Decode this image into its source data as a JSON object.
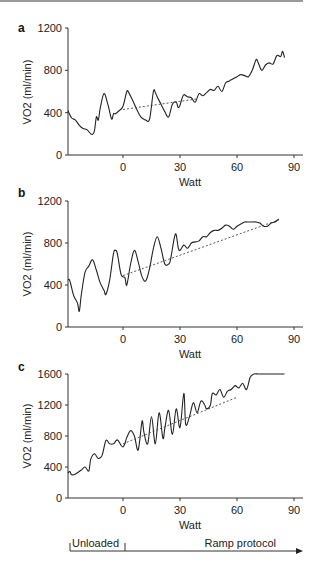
{
  "chart_data": [
    {
      "type": "line",
      "panel": "a",
      "xlabel": "Watt",
      "ylabel": "VO2 (ml/min)",
      "xticks": [
        0,
        30,
        60,
        90
      ],
      "yticks": [
        0,
        400,
        800,
        1200
      ],
      "ylim": [
        0,
        1200
      ],
      "xlim": [
        -29,
        93
      ],
      "series": [
        {
          "name": "VO2",
          "style": "solid",
          "x": [
            -29,
            -27,
            -25,
            -23,
            -21,
            -19,
            -17,
            -16,
            -15,
            -14,
            -13,
            -12,
            -10,
            -8,
            -6,
            -5,
            -4,
            -2,
            0,
            2,
            3,
            5,
            7,
            9,
            10,
            12,
            14,
            16,
            17,
            18,
            20,
            22,
            24,
            26,
            28,
            29,
            30,
            31,
            32,
            34,
            36,
            38,
            40,
            42,
            44,
            46,
            48,
            50,
            52,
            54,
            56,
            58,
            60,
            62,
            64,
            66,
            68,
            70,
            71,
            73,
            75,
            77,
            79,
            81,
            83,
            84,
            85
          ],
          "y": [
            420,
            350,
            330,
            280,
            250,
            240,
            200,
            195,
            230,
            360,
            330,
            440,
            580,
            480,
            340,
            390,
            390,
            420,
            460,
            600,
            590,
            520,
            440,
            370,
            350,
            330,
            340,
            600,
            590,
            550,
            480,
            410,
            360,
            480,
            500,
            450,
            470,
            530,
            570,
            550,
            540,
            500,
            580,
            560,
            590,
            620,
            610,
            650,
            600,
            680,
            700,
            720,
            740,
            760,
            750,
            740,
            800,
            900,
            880,
            800,
            850,
            870,
            860,
            940,
            930,
            980,
            920
          ]
        },
        {
          "name": "Linear trend",
          "style": "dotted",
          "x": [
            0,
            39
          ],
          "y": [
            430,
            530
          ]
        }
      ]
    },
    {
      "type": "line",
      "panel": "b",
      "xlabel": "Watt",
      "ylabel": "VO2 (ml/min)",
      "xticks": [
        0,
        30,
        60,
        90
      ],
      "yticks": [
        0,
        400,
        800,
        1200
      ],
      "ylim": [
        0,
        1200
      ],
      "xlim": [
        -29,
        93
      ],
      "series": [
        {
          "name": "VO2",
          "style": "solid",
          "x": [
            -29,
            -28,
            -26,
            -24,
            -23,
            -22,
            -20,
            -18,
            -16,
            -14,
            -12,
            -10,
            -9,
            -7,
            -5,
            -4,
            -3,
            -1,
            1,
            2,
            4,
            6,
            8,
            10,
            12,
            14,
            16,
            18,
            20,
            22,
            24,
            25,
            27,
            28,
            29,
            30,
            32,
            34,
            36,
            38,
            40,
            42,
            44,
            46,
            48,
            50,
            52,
            54,
            56,
            58,
            60,
            62,
            64,
            66,
            68,
            70,
            72,
            74,
            76,
            78,
            80,
            82
          ],
          "y": [
            450,
            440,
            300,
            230,
            150,
            300,
            520,
            580,
            640,
            540,
            420,
            350,
            310,
            450,
            700,
            730,
            700,
            500,
            470,
            400,
            600,
            730,
            620,
            480,
            440,
            560,
            750,
            860,
            750,
            600,
            600,
            640,
            850,
            880,
            760,
            730,
            780,
            750,
            800,
            810,
            820,
            860,
            860,
            900,
            920,
            920,
            940,
            970,
            960,
            930,
            960,
            980,
            1000,
            1000,
            1000,
            1000,
            990,
            960,
            960,
            990,
            1000,
            1030
          ]
        },
        {
          "name": "Linear trend",
          "style": "dotted",
          "x": [
            0,
            82
          ],
          "y": [
            490,
            1020
          ]
        }
      ]
    },
    {
      "type": "line",
      "panel": "c",
      "xlabel": "Watt",
      "ylabel": "VO2 (ml/min)",
      "xticks": [
        0,
        30,
        60,
        90
      ],
      "yticks": [
        0,
        400,
        800,
        1200,
        1600
      ],
      "ylim": [
        0,
        1600
      ],
      "xlim": [
        -29,
        93
      ],
      "series": [
        {
          "name": "VO2",
          "style": "solid",
          "x": [
            -29,
            -28,
            -27,
            -25,
            -22,
            -20,
            -18,
            -17,
            -15,
            -13,
            -11,
            -9,
            -7,
            -5,
            -3,
            -1,
            0,
            1,
            2,
            4,
            6,
            8,
            10,
            11,
            13,
            15,
            17,
            19,
            21,
            22,
            24,
            26,
            28,
            30,
            32,
            33,
            35,
            37,
            39,
            41,
            43,
            44,
            46,
            47,
            49,
            51,
            53,
            55,
            57,
            59,
            61,
            63,
            65,
            67,
            69,
            71,
            73,
            75,
            77,
            79,
            81,
            83,
            85
          ],
          "y": [
            320,
            340,
            300,
            310,
            360,
            400,
            350,
            500,
            570,
            510,
            550,
            740,
            700,
            700,
            750,
            680,
            660,
            700,
            780,
            870,
            800,
            620,
            990,
            850,
            700,
            1050,
            700,
            1100,
            770,
            900,
            1130,
            820,
            1150,
            910,
            1350,
            950,
            1050,
            1230,
            1100,
            1250,
            1200,
            1150,
            1200,
            1350,
            1330,
            1400,
            1300,
            1380,
            1400,
            1450,
            1420,
            1480,
            1400,
            1560,
            1600,
            1600,
            1600,
            1600,
            1600,
            1600,
            1600,
            1600,
            1600
          ]
        },
        {
          "name": "Linear trend",
          "style": "dotted",
          "x": [
            0,
            60
          ],
          "y": [
            700,
            1300
          ]
        }
      ]
    }
  ],
  "panels": [
    {
      "label": "a",
      "xlabel": "Watt",
      "ylabel": "VO2 (ml/min)",
      "yticks": [
        "0",
        "400",
        "800",
        "1200"
      ],
      "xticks": [
        "0",
        "30",
        "60",
        "90"
      ]
    },
    {
      "label": "b",
      "xlabel": "Watt",
      "ylabel": "VO2 (ml/min)",
      "yticks": [
        "0",
        "400",
        "800",
        "1200"
      ],
      "xticks": [
        "0",
        "30",
        "60",
        "90"
      ]
    },
    {
      "label": "c",
      "xlabel": "Watt",
      "ylabel": "VO2 (ml/min)",
      "yticks": [
        "0",
        "400",
        "800",
        "1200",
        "1600"
      ],
      "xticks": [
        "0",
        "30",
        "60",
        "90"
      ]
    }
  ],
  "protocol": {
    "unloaded_label": "Unloaded",
    "ramp_label": "Ramp protocol"
  }
}
